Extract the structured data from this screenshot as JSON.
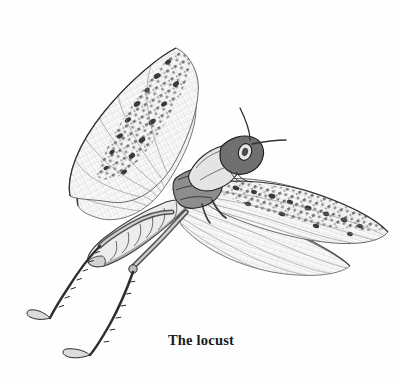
{
  "plate": {
    "caption": "The locust",
    "background_color": "#fefefe",
    "ink_color": "#3d3d3d",
    "dark_ink_color": "#262626",
    "caption_color": "#1a1a1a",
    "medium": "engraving",
    "subject": "locust",
    "orientation": "left-facing body, head to upper right, wings spread"
  },
  "anatomy": {
    "parts": [
      {
        "name": "head",
        "label": "head"
      },
      {
        "name": "compound-eye",
        "label": "compound eye"
      },
      {
        "name": "antenna-upper",
        "label": "upper antenna"
      },
      {
        "name": "antenna-lower",
        "label": "lower antenna"
      },
      {
        "name": "pronotum",
        "label": "pronotum"
      },
      {
        "name": "thorax",
        "label": "thorax"
      },
      {
        "name": "abdomen",
        "label": "segmented abdomen"
      },
      {
        "name": "forewing-left",
        "label": "raised left forewing"
      },
      {
        "name": "hindwing-left",
        "label": "raised left hindwing"
      },
      {
        "name": "forewing-right",
        "label": "extended right forewing"
      },
      {
        "name": "hindwing-right",
        "label": "extended right hindwing"
      },
      {
        "name": "hind-leg-upper",
        "label": "upper hind leg"
      },
      {
        "name": "hind-leg-lower",
        "label": "lower hind leg"
      },
      {
        "name": "tarsus-upper",
        "label": "upper tarsus with claw"
      },
      {
        "name": "tarsus-lower",
        "label": "lower tarsus with claw"
      }
    ]
  }
}
